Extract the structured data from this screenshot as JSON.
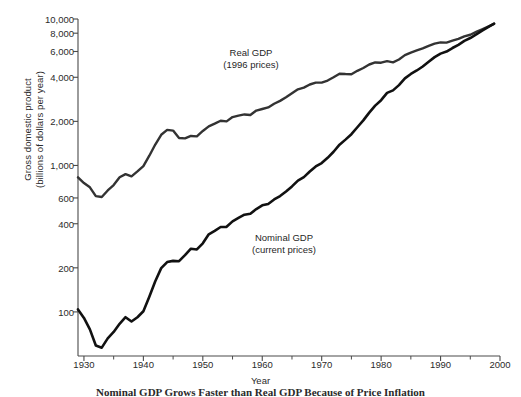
{
  "chart_data": {
    "type": "line",
    "title": "",
    "caption": "Nominal GDP Grows Faster than Real GDP Because of Price Inflation",
    "xlabel": "Year",
    "ylabel": "Gross domestic product\n(billions of dollars per year)",
    "yscale": "log",
    "xscale": "linear",
    "xlim": [
      1929,
      1999
    ],
    "ylim": [
      50,
      10000
    ],
    "grid": false,
    "legend_position": "inline-annotations",
    "xticks": [
      1930,
      1940,
      1950,
      1960,
      1970,
      1980,
      1990,
      2000
    ],
    "xtick_labels": [
      "1930",
      "1940",
      "1950",
      "1960",
      "1970",
      "1980",
      "1990",
      "2000"
    ],
    "xminor_ticks": [
      1935,
      1945,
      1955,
      1965,
      1975,
      1985,
      1995
    ],
    "yticks": [
      100,
      200,
      400,
      600,
      1000,
      2000,
      4000,
      6000,
      8000,
      10000
    ],
    "ytick_labels": [
      "100",
      "200",
      "400",
      "600",
      "1,000",
      "2,000",
      "4,000",
      "6,000",
      "8,000",
      "10,000"
    ],
    "series": [
      {
        "name": "Real GDP",
        "sublabel": "(1996 prices)",
        "annotation": "Real GDP\n(1996 prices)",
        "color": "#333333",
        "x": [
          1929,
          1930,
          1931,
          1932,
          1933,
          1934,
          1935,
          1936,
          1937,
          1938,
          1939,
          1940,
          1941,
          1942,
          1943,
          1944,
          1945,
          1946,
          1947,
          1948,
          1949,
          1950,
          1951,
          1952,
          1953,
          1954,
          1955,
          1956,
          1957,
          1958,
          1959,
          1960,
          1961,
          1962,
          1963,
          1964,
          1965,
          1966,
          1967,
          1968,
          1969,
          1970,
          1971,
          1972,
          1973,
          1974,
          1975,
          1976,
          1977,
          1978,
          1979,
          1980,
          1981,
          1982,
          1983,
          1984,
          1985,
          1986,
          1987,
          1988,
          1989,
          1990,
          1991,
          1992,
          1993,
          1994,
          1995,
          1996,
          1997,
          1998,
          1999
        ],
        "y": [
          830,
          758,
          709,
          617,
          609,
          675,
          735,
          830,
          873,
          843,
          911,
          990,
          1166,
          1390,
          1620,
          1750,
          1730,
          1540,
          1530,
          1590,
          1580,
          1720,
          1850,
          1930,
          2020,
          2000,
          2140,
          2190,
          2230,
          2210,
          2370,
          2430,
          2490,
          2640,
          2760,
          2920,
          3110,
          3310,
          3400,
          3570,
          3680,
          3680,
          3800,
          4000,
          4230,
          4210,
          4200,
          4430,
          4630,
          4890,
          5050,
          5030,
          5160,
          5060,
          5290,
          5670,
          5900,
          6100,
          6300,
          6560,
          6790,
          6920,
          6900,
          7110,
          7310,
          7610,
          7810,
          8160,
          8510,
          8880,
          9270
        ]
      },
      {
        "name": "Nominal GDP",
        "sublabel": "(current prices)",
        "annotation": "Nominal GDP\n(current prices)",
        "color": "#111111",
        "x": [
          1929,
          1930,
          1931,
          1932,
          1933,
          1934,
          1935,
          1936,
          1937,
          1938,
          1939,
          1940,
          1941,
          1942,
          1943,
          1944,
          1945,
          1946,
          1947,
          1948,
          1949,
          1950,
          1951,
          1952,
          1953,
          1954,
          1955,
          1956,
          1957,
          1958,
          1959,
          1960,
          1961,
          1962,
          1963,
          1964,
          1965,
          1966,
          1967,
          1968,
          1969,
          1970,
          1971,
          1972,
          1973,
          1974,
          1975,
          1976,
          1977,
          1978,
          1979,
          1980,
          1981,
          1982,
          1983,
          1984,
          1985,
          1986,
          1987,
          1988,
          1989,
          1990,
          1991,
          1992,
          1993,
          1994,
          1995,
          1996,
          1997,
          1998,
          1999
        ],
        "y": [
          104,
          91,
          76,
          59,
          57,
          66,
          73,
          83,
          92,
          86,
          92,
          101,
          127,
          162,
          199,
          219,
          223,
          222,
          244,
          270,
          267,
          294,
          339,
          358,
          380,
          381,
          415,
          438,
          461,
          468,
          504,
          534,
          546,
          586,
          618,
          664,
          719,
          788,
          833,
          910,
          985,
          1039,
          1128,
          1240,
          1386,
          1501,
          1635,
          1824,
          2031,
          2295,
          2563,
          2790,
          3128,
          3255,
          3537,
          3933,
          4213,
          4453,
          4742,
          5108,
          5489,
          5803,
          5996,
          6338,
          6667,
          7085,
          7415,
          7839,
          8332,
          8790,
          9299
        ]
      }
    ]
  },
  "axis": {
    "ylabel_line1": "Gross domestic product",
    "ylabel_line2": "(billions of dollars per year)",
    "xlabel": "Year"
  }
}
